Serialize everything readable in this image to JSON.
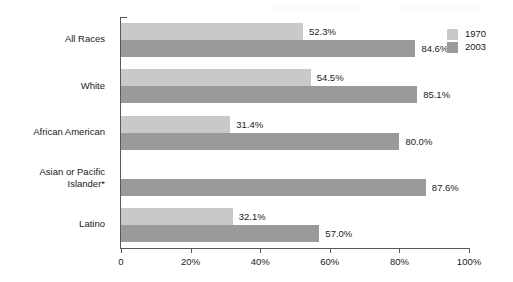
{
  "chart_data": {
    "type": "bar",
    "orientation": "horizontal",
    "title": "",
    "subtitle": "",
    "xlabel": "",
    "ylabel": "",
    "xlim": [
      0,
      100
    ],
    "xticks": [
      0,
      20,
      40,
      60,
      80,
      100
    ],
    "xtick_labels": [
      "0",
      "20%",
      "40%",
      "60%",
      "80%",
      "100%"
    ],
    "grid": false,
    "legend_position": "top-right",
    "categories": [
      "All Races",
      "White",
      "African American",
      "Asian or Pacific Islander*",
      "Latino"
    ],
    "series": [
      {
        "name": "1970",
        "color": "#c9c9c9",
        "values": [
          52.3,
          54.5,
          31.4,
          null,
          32.1
        ],
        "labels": [
          "52.3%",
          "54.5%",
          "31.4%",
          "",
          "32.1%"
        ]
      },
      {
        "name": "2003",
        "color": "#9a9a9a",
        "values": [
          84.6,
          85.1,
          80.0,
          87.6,
          57.0
        ],
        "labels": [
          "84.6%",
          "85.1%",
          "80.0%",
          "87.6%",
          "57.0%"
        ]
      }
    ]
  },
  "category_labels": [
    {
      "lines": [
        "All Races"
      ]
    },
    {
      "lines": [
        "White"
      ]
    },
    {
      "lines": [
        "African American"
      ]
    },
    {
      "lines": [
        "Asian or Pacific",
        "Islander*"
      ]
    },
    {
      "lines": [
        "Latino"
      ]
    }
  ],
  "legend": {
    "entries": [
      {
        "label": "1970",
        "color": "#c9c9c9"
      },
      {
        "label": "2003",
        "color": "#9a9a9a"
      }
    ]
  },
  "axis": {
    "tick_labels": [
      "0",
      "20%",
      "40%",
      "60%",
      "80%",
      "100%"
    ],
    "line_color": "#595959"
  }
}
